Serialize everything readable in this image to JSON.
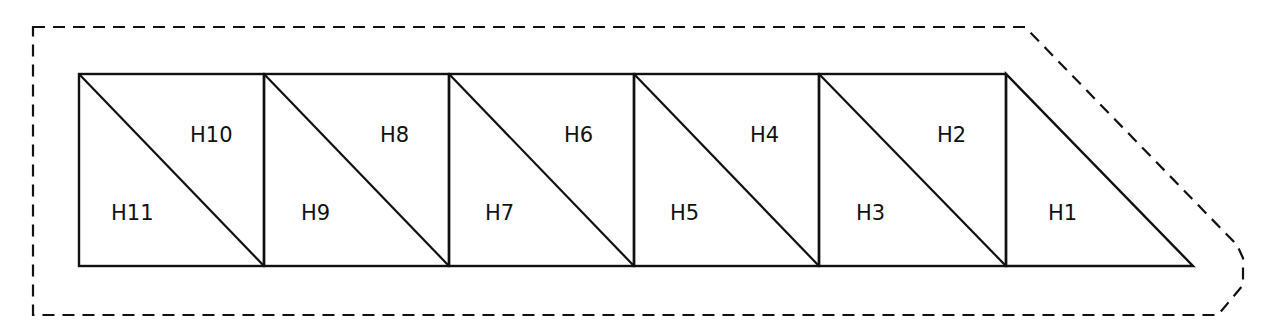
{
  "diagram": {
    "stroke_color": "#111111",
    "background": "#ffffff",
    "boundary": {
      "style": "dashed",
      "points": [
        [
          33,
          27
        ],
        [
          1025,
          27
        ],
        [
          1237,
          245
        ],
        [
          1243,
          258
        ],
        [
          1243,
          285
        ],
        [
          1218,
          315
        ],
        [
          33,
          315
        ]
      ]
    },
    "strip": {
      "top": 74,
      "bottom": 266,
      "left": 79,
      "right_apex": 1193
    },
    "cells": [
      {
        "index": 1,
        "x0": 79,
        "x1": 264,
        "upper_label": "H10",
        "lower_label": "H11"
      },
      {
        "index": 2,
        "x0": 264,
        "x1": 449,
        "upper_label": "H8",
        "lower_label": "H9"
      },
      {
        "index": 3,
        "x0": 449,
        "x1": 634,
        "upper_label": "H6",
        "lower_label": "H7"
      },
      {
        "index": 4,
        "x0": 634,
        "x1": 819,
        "upper_label": "H4",
        "lower_label": "H5"
      },
      {
        "index": 5,
        "x0": 819,
        "x1": 1006,
        "upper_label": "H2",
        "lower_label": "H3"
      }
    ],
    "end_triangle": {
      "label": "H1",
      "points": [
        [
          1006,
          74
        ],
        [
          1006,
          266
        ],
        [
          1193,
          266
        ]
      ]
    },
    "labels": [
      {
        "text": "H10",
        "x": 190,
        "y": 142
      },
      {
        "text": "H11",
        "x": 111,
        "y": 220
      },
      {
        "text": "H8",
        "x": 380,
        "y": 142
      },
      {
        "text": "H9",
        "x": 301,
        "y": 220
      },
      {
        "text": "H6",
        "x": 564,
        "y": 142
      },
      {
        "text": "H7",
        "x": 485,
        "y": 220
      },
      {
        "text": "H4",
        "x": 750,
        "y": 142
      },
      {
        "text": "H5",
        "x": 670,
        "y": 220
      },
      {
        "text": "H2",
        "x": 937,
        "y": 142
      },
      {
        "text": "H3",
        "x": 856,
        "y": 220
      },
      {
        "text": "H1",
        "x": 1048,
        "y": 220
      }
    ]
  }
}
